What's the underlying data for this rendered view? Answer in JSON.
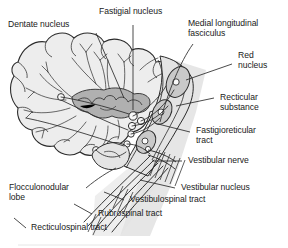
{
  "figure": {
    "background_color": "#ffffff",
    "line_color": "#2b2b2b",
    "tissue_fill": "#ededed",
    "nucleus_fill": "#b8b8b8",
    "shadow_fill": "#d9d9d9",
    "text_color": "#1a1a1a"
  },
  "labels": {
    "dentate_nucleus": "Dentate nucleus",
    "fastigial_nucleus": "Fastigial nucleus",
    "medial_longitudinal_fasciculus": "Medial longitudinal\nfasciculus",
    "red_nucleus": "Red\nnucleus",
    "recticular_substance": "Recticular\nsubstance",
    "fastigioreticular_tract": "Fastigioreticular\ntract",
    "vestibular_nerve": "Vestibular nerve",
    "vestibular_nucleus": "Vestibular nucleus",
    "vestibulospinal_tract": "Vestibulospinal tract",
    "rubrospinal_tract": "Rubrospinal tract",
    "recticulospinal_tract": "Recticulospinal tract",
    "flocculonodular_lobe": "Flocculonodular\nlobe"
  }
}
